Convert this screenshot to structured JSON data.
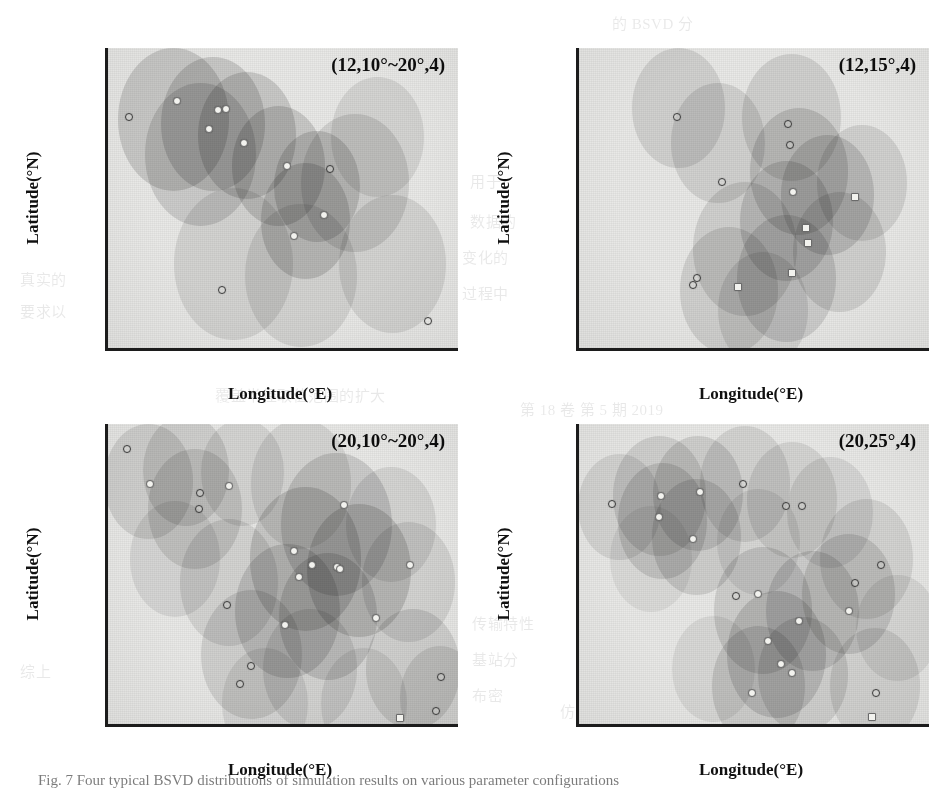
{
  "figure": {
    "axis_title_x": "Longitude(°E)",
    "axis_title_y": "Latitude(°N)",
    "caption": "Fig. 7  Four typical BSVD distributions of simulation results on various parameter configurations"
  },
  "ghost_text": [
    {
      "text": "的 BSVD 分",
      "x": 612,
      "y": 12
    },
    {
      "text": "用于",
      "x": 470,
      "y": 170
    },
    {
      "text": "数据的",
      "x": 470,
      "y": 210
    },
    {
      "text": "变化的",
      "x": 462,
      "y": 246
    },
    {
      "text": "过程中",
      "x": 462,
      "y": 282
    },
    {
      "text": "真实的",
      "x": 20,
      "y": 268
    },
    {
      "text": "要求以",
      "x": 20,
      "y": 300
    },
    {
      "text": "布情况",
      "x": 160,
      "y": 262
    },
    {
      "text": "计算所得",
      "x": 300,
      "y": 252
    },
    {
      "text": "而覆盖范围",
      "x": 300,
      "y": 300
    },
    {
      "text": "基站数量相同的条件下",
      "x": 150,
      "y": 330
    },
    {
      "text": "覆盖半径取值范围的扩大",
      "x": 215,
      "y": 384
    },
    {
      "text": "第 18 卷  第 5 期  2019",
      "x": 520,
      "y": 398
    },
    {
      "text": "传输特性",
      "x": 472,
      "y": 612
    },
    {
      "text": "基站分",
      "x": 472,
      "y": 648
    },
    {
      "text": "布密",
      "x": 472,
      "y": 684
    },
    {
      "text": "综上",
      "x": 20,
      "y": 660
    },
    {
      "text": "仿真结果表明",
      "x": 560,
      "y": 700
    },
    {
      "text": "BSVD 分布",
      "x": 210,
      "y": 706
    }
  ],
  "chart_data": [
    {
      "id": "panel-top-left",
      "type": "scatter",
      "title": "(12,10°~20°,4)",
      "xlabel": "Longitude(°E)",
      "ylabel": "Latitude(°N)",
      "xlim": [
        118.55,
        122.45
      ],
      "ylim": [
        29.62,
        32.22
      ],
      "xticks": [
        119,
        120,
        121,
        122
      ],
      "yticks": [
        30.0,
        30.5,
        31.0,
        31.5,
        32.0
      ],
      "xticklabels": [
        "119",
        "120",
        "121",
        "122"
      ],
      "yticklabels": [
        "30.0",
        "30.5",
        "31.0",
        "31.5",
        "32.0"
      ],
      "grid": false,
      "legend": null,
      "params": {
        "base_stations": 12,
        "coverage_radius_deg": "10°~20°",
        "sectors": 4
      },
      "points": [
        {
          "lon": 118.78,
          "lat": 31.62,
          "style": "hollow"
        },
        {
          "lon": 119.32,
          "lat": 31.76,
          "style": "solid"
        },
        {
          "lon": 119.78,
          "lat": 31.68,
          "style": "solid"
        },
        {
          "lon": 119.86,
          "lat": 31.69,
          "style": "solid"
        },
        {
          "lon": 119.68,
          "lat": 31.52,
          "style": "solid"
        },
        {
          "lon": 120.06,
          "lat": 31.4,
          "style": "solid"
        },
        {
          "lon": 120.54,
          "lat": 31.2,
          "style": "solid"
        },
        {
          "lon": 121.02,
          "lat": 31.17,
          "style": "hollow"
        },
        {
          "lon": 120.96,
          "lat": 30.77,
          "style": "solid"
        },
        {
          "lon": 120.62,
          "lat": 30.59,
          "style": "solid"
        },
        {
          "lon": 119.82,
          "lat": 30.12,
          "style": "hollow"
        },
        {
          "lon": 122.12,
          "lat": 29.85,
          "style": "hollow"
        }
      ],
      "discs": [
        {
          "lon": 119.28,
          "lat": 31.6,
          "r_deg": 0.62,
          "weight": 0.22
        },
        {
          "lon": 119.72,
          "lat": 31.56,
          "r_deg": 0.58,
          "weight": 0.22
        },
        {
          "lon": 120.1,
          "lat": 31.46,
          "r_deg": 0.55,
          "weight": 0.22
        },
        {
          "lon": 119.58,
          "lat": 31.3,
          "r_deg": 0.62,
          "weight": 0.2
        },
        {
          "lon": 120.45,
          "lat": 31.2,
          "r_deg": 0.52,
          "weight": 0.22
        },
        {
          "lon": 120.88,
          "lat": 31.02,
          "r_deg": 0.48,
          "weight": 0.22
        },
        {
          "lon": 120.75,
          "lat": 30.72,
          "r_deg": 0.5,
          "weight": 0.22
        },
        {
          "lon": 121.3,
          "lat": 31.05,
          "r_deg": 0.6,
          "weight": 0.17
        },
        {
          "lon": 119.95,
          "lat": 30.35,
          "r_deg": 0.66,
          "weight": 0.15
        },
        {
          "lon": 120.7,
          "lat": 30.25,
          "r_deg": 0.62,
          "weight": 0.15
        },
        {
          "lon": 121.72,
          "lat": 30.35,
          "r_deg": 0.6,
          "weight": 0.15
        },
        {
          "lon": 121.55,
          "lat": 31.45,
          "r_deg": 0.52,
          "weight": 0.14
        }
      ]
    },
    {
      "id": "panel-top-right",
      "type": "scatter",
      "title": "(12,15°,4)",
      "xlabel": "Longitude(°E)",
      "ylabel": "Latitude(°N)",
      "xlim": [
        118.55,
        122.45
      ],
      "ylim": [
        29.62,
        32.22
      ],
      "xticks": [
        119,
        120,
        121,
        122
      ],
      "yticks": [
        30.0,
        30.5,
        31.0,
        31.5,
        32.0
      ],
      "xticklabels": [
        "119",
        "120",
        "121",
        "122"
      ],
      "yticklabels": [
        "30.0",
        "30.5",
        "31.0",
        "31.5",
        "32.0"
      ],
      "grid": false,
      "legend": null,
      "params": {
        "base_stations": 12,
        "coverage_radius_deg": "15°",
        "sectors": 4
      },
      "points": [
        {
          "lon": 119.64,
          "lat": 31.62,
          "style": "hollow"
        },
        {
          "lon": 120.88,
          "lat": 31.56,
          "style": "hollow"
        },
        {
          "lon": 120.9,
          "lat": 31.38,
          "style": "hollow"
        },
        {
          "lon": 120.14,
          "lat": 31.06,
          "style": "hollow"
        },
        {
          "lon": 120.94,
          "lat": 30.97,
          "style": "solid"
        },
        {
          "lon": 121.62,
          "lat": 30.93,
          "style": "sq"
        },
        {
          "lon": 121.08,
          "lat": 30.66,
          "style": "sq"
        },
        {
          "lon": 121.1,
          "lat": 30.53,
          "style": "sq"
        },
        {
          "lon": 120.92,
          "lat": 30.27,
          "style": "sq"
        },
        {
          "lon": 119.86,
          "lat": 30.23,
          "style": "hollow"
        },
        {
          "lon": 119.82,
          "lat": 30.17,
          "style": "hollow"
        },
        {
          "lon": 120.32,
          "lat": 30.15,
          "style": "sq"
        }
      ],
      "discs": [
        {
          "lon": 119.66,
          "lat": 31.7,
          "r_deg": 0.52,
          "weight": 0.16
        },
        {
          "lon": 120.1,
          "lat": 31.4,
          "r_deg": 0.52,
          "weight": 0.16
        },
        {
          "lon": 120.92,
          "lat": 31.62,
          "r_deg": 0.55,
          "weight": 0.17
        },
        {
          "lon": 121.0,
          "lat": 31.15,
          "r_deg": 0.55,
          "weight": 0.2
        },
        {
          "lon": 121.32,
          "lat": 30.95,
          "r_deg": 0.52,
          "weight": 0.2
        },
        {
          "lon": 121.7,
          "lat": 31.05,
          "r_deg": 0.5,
          "weight": 0.16
        },
        {
          "lon": 120.86,
          "lat": 30.72,
          "r_deg": 0.52,
          "weight": 0.2
        },
        {
          "lon": 120.4,
          "lat": 30.48,
          "r_deg": 0.58,
          "weight": 0.17
        },
        {
          "lon": 120.22,
          "lat": 30.12,
          "r_deg": 0.55,
          "weight": 0.17
        },
        {
          "lon": 120.86,
          "lat": 30.22,
          "r_deg": 0.55,
          "weight": 0.19
        },
        {
          "lon": 121.45,
          "lat": 30.45,
          "r_deg": 0.52,
          "weight": 0.17
        },
        {
          "lon": 120.6,
          "lat": 29.95,
          "r_deg": 0.5,
          "weight": 0.15
        }
      ]
    },
    {
      "id": "panel-bottom-left",
      "type": "scatter",
      "title": "(20,10°~20°,4)",
      "xlabel": "Longitude(°E)",
      "ylabel": "Latitude(°N)",
      "xlim": [
        118.55,
        122.45
      ],
      "ylim": [
        29.62,
        32.22
      ],
      "xticks": [
        119,
        120,
        121,
        122
      ],
      "yticks": [
        30.0,
        30.5,
        31.0,
        31.5,
        32.0
      ],
      "xticklabels": [
        "119",
        "120",
        "121",
        "122"
      ],
      "yticklabels": [
        "30.0",
        "30.5",
        "31.0",
        "31.5",
        "32.0"
      ],
      "grid": false,
      "legend": null,
      "params": {
        "base_stations": 20,
        "coverage_radius_deg": "10°~20°",
        "sectors": 4
      },
      "points": [
        {
          "lon": 118.76,
          "lat": 32.0,
          "style": "hollow"
        },
        {
          "lon": 119.02,
          "lat": 31.7,
          "style": "solid"
        },
        {
          "lon": 119.58,
          "lat": 31.62,
          "style": "hollow"
        },
        {
          "lon": 119.56,
          "lat": 31.48,
          "style": "hollow"
        },
        {
          "lon": 121.18,
          "lat": 31.52,
          "style": "solid"
        },
        {
          "lon": 120.62,
          "lat": 31.12,
          "style": "solid"
        },
        {
          "lon": 120.82,
          "lat": 31.0,
          "style": "solid"
        },
        {
          "lon": 121.1,
          "lat": 30.98,
          "style": "solid"
        },
        {
          "lon": 121.14,
          "lat": 30.96,
          "style": "solid"
        },
        {
          "lon": 120.68,
          "lat": 30.89,
          "style": "solid"
        },
        {
          "lon": 121.92,
          "lat": 31.0,
          "style": "solid"
        },
        {
          "lon": 119.88,
          "lat": 30.65,
          "style": "hollow"
        },
        {
          "lon": 120.52,
          "lat": 30.48,
          "style": "solid"
        },
        {
          "lon": 121.54,
          "lat": 30.54,
          "style": "solid"
        },
        {
          "lon": 120.14,
          "lat": 30.12,
          "style": "hollow"
        },
        {
          "lon": 120.02,
          "lat": 29.97,
          "style": "hollow"
        },
        {
          "lon": 122.26,
          "lat": 30.03,
          "style": "hollow"
        },
        {
          "lon": 122.2,
          "lat": 29.73,
          "style": "hollow"
        },
        {
          "lon": 121.8,
          "lat": 29.67,
          "style": "sq"
        },
        {
          "lon": 119.9,
          "lat": 31.68,
          "style": "solid"
        }
      ],
      "discs": [
        {
          "lon": 119.0,
          "lat": 31.72,
          "r_deg": 0.5,
          "weight": 0.17
        },
        {
          "lon": 119.42,
          "lat": 31.82,
          "r_deg": 0.48,
          "weight": 0.17
        },
        {
          "lon": 119.52,
          "lat": 31.48,
          "r_deg": 0.52,
          "weight": 0.17
        },
        {
          "lon": 120.05,
          "lat": 31.8,
          "r_deg": 0.46,
          "weight": 0.14
        },
        {
          "lon": 120.7,
          "lat": 31.7,
          "r_deg": 0.56,
          "weight": 0.14
        },
        {
          "lon": 121.1,
          "lat": 31.35,
          "r_deg": 0.62,
          "weight": 0.2
        },
        {
          "lon": 120.75,
          "lat": 31.05,
          "r_deg": 0.62,
          "weight": 0.22
        },
        {
          "lon": 121.35,
          "lat": 30.95,
          "r_deg": 0.58,
          "weight": 0.22
        },
        {
          "lon": 120.55,
          "lat": 30.6,
          "r_deg": 0.58,
          "weight": 0.2
        },
        {
          "lon": 121.0,
          "lat": 30.55,
          "r_deg": 0.55,
          "weight": 0.2
        },
        {
          "lon": 119.9,
          "lat": 30.85,
          "r_deg": 0.55,
          "weight": 0.15
        },
        {
          "lon": 120.15,
          "lat": 30.22,
          "r_deg": 0.56,
          "weight": 0.17
        },
        {
          "lon": 120.8,
          "lat": 30.1,
          "r_deg": 0.52,
          "weight": 0.15
        },
        {
          "lon": 121.7,
          "lat": 31.35,
          "r_deg": 0.5,
          "weight": 0.14
        },
        {
          "lon": 121.9,
          "lat": 30.85,
          "r_deg": 0.52,
          "weight": 0.15
        },
        {
          "lon": 121.95,
          "lat": 30.1,
          "r_deg": 0.52,
          "weight": 0.17
        },
        {
          "lon": 122.25,
          "lat": 29.85,
          "r_deg": 0.45,
          "weight": 0.15
        },
        {
          "lon": 119.3,
          "lat": 31.05,
          "r_deg": 0.5,
          "weight": 0.13
        },
        {
          "lon": 120.3,
          "lat": 29.8,
          "r_deg": 0.48,
          "weight": 0.13
        },
        {
          "lon": 121.4,
          "lat": 29.8,
          "r_deg": 0.48,
          "weight": 0.13
        }
      ]
    },
    {
      "id": "panel-bottom-right",
      "type": "scatter",
      "title": "(20,25°,4)",
      "xlabel": "Longitude(°E)",
      "ylabel": "Latitude(°N)",
      "xlim": [
        118.55,
        122.45
      ],
      "ylim": [
        29.62,
        32.22
      ],
      "xticks": [
        119,
        120,
        121,
        122
      ],
      "yticks": [
        30.0,
        30.5,
        31.0,
        31.5,
        32.0
      ],
      "xticklabels": [
        "119",
        "120",
        "121",
        "122"
      ],
      "yticklabels": [
        "30.0",
        "30.5",
        "31.0",
        "31.5",
        "32.0"
      ],
      "grid": false,
      "legend": null,
      "params": {
        "base_stations": 20,
        "coverage_radius_deg": "25°",
        "sectors": 4
      },
      "points": [
        {
          "lon": 118.92,
          "lat": 31.53,
          "style": "hollow"
        },
        {
          "lon": 119.46,
          "lat": 31.6,
          "style": "solid"
        },
        {
          "lon": 119.44,
          "lat": 31.41,
          "style": "solid"
        },
        {
          "lon": 119.9,
          "lat": 31.63,
          "style": "solid"
        },
        {
          "lon": 119.82,
          "lat": 31.22,
          "style": "solid"
        },
        {
          "lon": 120.38,
          "lat": 31.7,
          "style": "hollow"
        },
        {
          "lon": 120.86,
          "lat": 31.51,
          "style": "hollow"
        },
        {
          "lon": 121.04,
          "lat": 31.51,
          "style": "hollow"
        },
        {
          "lon": 121.92,
          "lat": 31.0,
          "style": "hollow"
        },
        {
          "lon": 121.62,
          "lat": 30.84,
          "style": "hollow"
        },
        {
          "lon": 121.56,
          "lat": 30.6,
          "style": "solid"
        },
        {
          "lon": 120.3,
          "lat": 30.73,
          "style": "hollow"
        },
        {
          "lon": 120.55,
          "lat": 30.75,
          "style": "solid"
        },
        {
          "lon": 121.0,
          "lat": 30.51,
          "style": "solid"
        },
        {
          "lon": 120.66,
          "lat": 30.34,
          "style": "solid"
        },
        {
          "lon": 120.8,
          "lat": 30.14,
          "style": "solid"
        },
        {
          "lon": 120.92,
          "lat": 30.06,
          "style": "solid"
        },
        {
          "lon": 120.48,
          "lat": 29.89,
          "style": "solid"
        },
        {
          "lon": 121.86,
          "lat": 29.89,
          "style": "hollow"
        },
        {
          "lon": 121.82,
          "lat": 29.68,
          "style": "sq"
        }
      ],
      "discs": [
        {
          "lon": 119.0,
          "lat": 31.5,
          "r_deg": 0.46,
          "weight": 0.14
        },
        {
          "lon": 119.45,
          "lat": 31.6,
          "r_deg": 0.52,
          "weight": 0.17
        },
        {
          "lon": 119.48,
          "lat": 31.38,
          "r_deg": 0.5,
          "weight": 0.18
        },
        {
          "lon": 119.88,
          "lat": 31.62,
          "r_deg": 0.5,
          "weight": 0.18
        },
        {
          "lon": 119.86,
          "lat": 31.24,
          "r_deg": 0.5,
          "weight": 0.18
        },
        {
          "lon": 120.4,
          "lat": 31.7,
          "r_deg": 0.5,
          "weight": 0.15
        },
        {
          "lon": 120.92,
          "lat": 31.56,
          "r_deg": 0.5,
          "weight": 0.14
        },
        {
          "lon": 121.35,
          "lat": 31.45,
          "r_deg": 0.48,
          "weight": 0.13
        },
        {
          "lon": 121.75,
          "lat": 31.05,
          "r_deg": 0.52,
          "weight": 0.15
        },
        {
          "lon": 121.55,
          "lat": 30.75,
          "r_deg": 0.52,
          "weight": 0.18
        },
        {
          "lon": 121.15,
          "lat": 30.6,
          "r_deg": 0.52,
          "weight": 0.19
        },
        {
          "lon": 120.6,
          "lat": 30.6,
          "r_deg": 0.55,
          "weight": 0.18
        },
        {
          "lon": 120.75,
          "lat": 30.22,
          "r_deg": 0.55,
          "weight": 0.2
        },
        {
          "lon": 120.55,
          "lat": 29.95,
          "r_deg": 0.52,
          "weight": 0.18
        },
        {
          "lon": 121.05,
          "lat": 30.05,
          "r_deg": 0.5,
          "weight": 0.17
        },
        {
          "lon": 121.85,
          "lat": 29.95,
          "r_deg": 0.5,
          "weight": 0.15
        },
        {
          "lon": 120.05,
          "lat": 30.1,
          "r_deg": 0.46,
          "weight": 0.11
        },
        {
          "lon": 119.35,
          "lat": 31.05,
          "r_deg": 0.46,
          "weight": 0.1
        },
        {
          "lon": 122.1,
          "lat": 30.45,
          "r_deg": 0.46,
          "weight": 0.12
        },
        {
          "lon": 120.55,
          "lat": 31.2,
          "r_deg": 0.46,
          "weight": 0.12
        }
      ]
    }
  ]
}
